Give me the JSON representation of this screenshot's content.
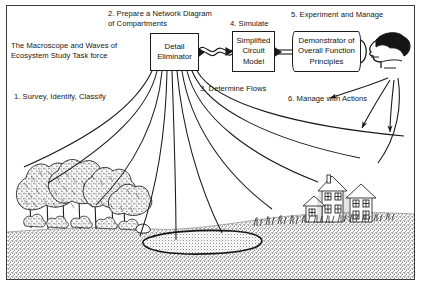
{
  "figure": {
    "title_text": "The Macroscope and Waves of\nEcosystem Study Task force",
    "boxes": [
      {
        "id": "detail_eliminator",
        "text": "Detail\nEliminator"
      },
      {
        "id": "simplified_circuit_model",
        "text": "Simplified\nCircuit\nModel"
      },
      {
        "id": "demonstrator",
        "text": "Demonstrator of\nOverall Function\nPrinciples"
      }
    ],
    "steps": [
      {
        "n": "1",
        "text": "1. Survey, Identify, Classify"
      },
      {
        "n": "2",
        "text": "2. Prepare a Network Diagram\nof Compartments"
      },
      {
        "n": "3",
        "text": "3. Determine Flows"
      },
      {
        "n": "4",
        "text": "4. Simulate"
      },
      {
        "n": "5",
        "text": "5. Experiment and Manage"
      },
      {
        "n": "6",
        "text": "6. Manage with Actions"
      }
    ],
    "scene": {
      "forest_label": "forest-trees",
      "houses_label": "houses-village",
      "pond_label": "pond",
      "ground_label": "stippled-ground",
      "observer_label": "human-head-profile"
    },
    "colors": {
      "ink": "#151515",
      "paper": "#ffffff",
      "ground": "#b4b4b4",
      "foliage": "#9a9a9a"
    }
  }
}
